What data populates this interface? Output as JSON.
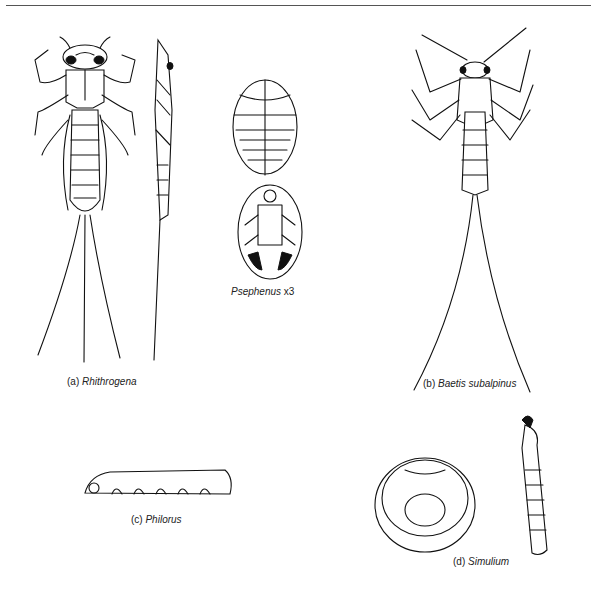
{
  "figure": {
    "specimens": [
      {
        "id": "a",
        "prefix": "(a)",
        "name": "Rhithrogena"
      },
      {
        "id": "psephenus",
        "prefix": "",
        "name": "Psephenus",
        "suffix": "x3"
      },
      {
        "id": "b",
        "prefix": "(b)",
        "name": "Baetis subalpinus"
      },
      {
        "id": "c",
        "prefix": "(c)",
        "name": "Philorus"
      },
      {
        "id": "d",
        "prefix": "(d)",
        "name": "Simulium"
      }
    ]
  }
}
